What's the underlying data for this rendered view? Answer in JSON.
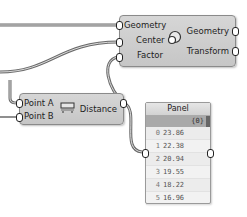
{
  "scale_component": {
    "inputs": [
      "Geometry",
      "Center",
      "Factor"
    ],
    "outputs": [
      "Geometry",
      "Transform"
    ],
    "icon": "scale-icon"
  },
  "distance_component": {
    "inputs": [
      "Point A",
      "Point B"
    ],
    "outputs": [
      "Distance"
    ],
    "icon": "distance-icon"
  },
  "panel": {
    "title": "Panel",
    "path": "{0}",
    "items": [
      {
        "index": "0",
        "value": "23.86"
      },
      {
        "index": "1",
        "value": "22.38"
      },
      {
        "index": "2",
        "value": "20.94"
      },
      {
        "index": "3",
        "value": "19.55"
      },
      {
        "index": "4",
        "value": "18.22"
      },
      {
        "index": "5",
        "value": "16.96"
      }
    ]
  }
}
